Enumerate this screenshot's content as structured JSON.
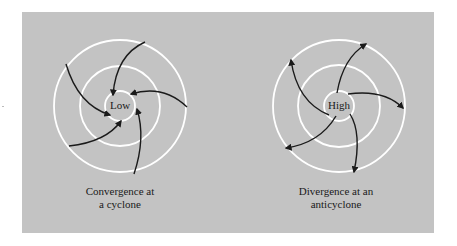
{
  "colors": {
    "panel": "#c3c3c3",
    "rings": "#ffffff",
    "arrows": "#1a1a1a"
  },
  "diagrams": [
    {
      "center_label": "Low",
      "caption_line1": "Convergence at",
      "caption_line2": "a cyclone",
      "flow": "inward"
    },
    {
      "center_label": "High",
      "caption_line1": "Divergence at an",
      "caption_line2": "anticyclone",
      "flow": "outward"
    }
  ]
}
